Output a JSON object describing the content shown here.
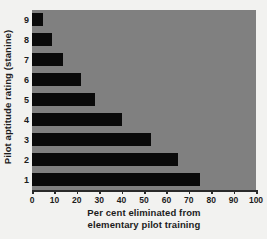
{
  "chart_data": {
    "type": "bar",
    "orientation": "horizontal",
    "title": "",
    "xlabel_line1": "Per cent eliminated from",
    "xlabel_line2": "elementary pilot training",
    "ylabel": "Pilot aptitude rating (stanine)",
    "categories": [
      "9",
      "8",
      "7",
      "6",
      "5",
      "4",
      "3",
      "2",
      "1"
    ],
    "values": [
      5,
      9,
      14,
      22,
      28,
      40,
      53,
      65,
      75
    ],
    "xticks": [
      0,
      10,
      20,
      30,
      40,
      50,
      60,
      70,
      80,
      90,
      100
    ],
    "xlim": [
      0,
      100
    ],
    "grid": false,
    "legend": "none",
    "colors": {
      "bar": "#0a0a0a",
      "plot_background": "#808080",
      "page_background": "#f2f2f0",
      "axis": "#2a2a2a",
      "text": "#1c1c1c"
    }
  }
}
